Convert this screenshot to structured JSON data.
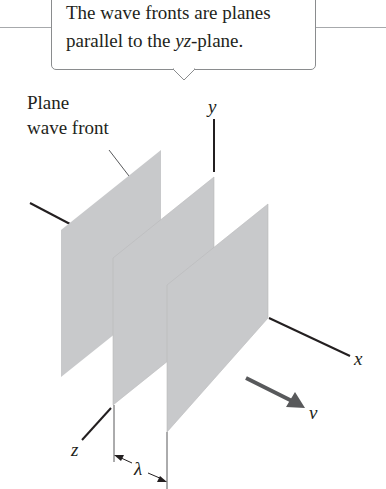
{
  "callout": {
    "line1": "The wave fronts are planes",
    "line2_pre": "parallel to the ",
    "line2_italic": "yz",
    "line2_post": "-plane."
  },
  "labels": {
    "plane_line1": "Plane",
    "plane_line2": "wave front"
  },
  "axes": {
    "x": "x",
    "y": "y",
    "z": "z"
  },
  "velocity_label": "v",
  "wavelength_label": "λ",
  "colors": {
    "plane_fill": "#c8c9cb",
    "axis": "#231f20",
    "arrow": "#58595b",
    "rule": "#a7a9ac"
  }
}
